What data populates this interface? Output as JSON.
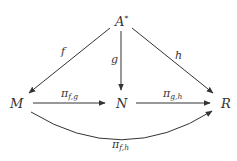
{
  "diagram": {
    "type": "commutative-diagram",
    "nodes": {
      "A": {
        "base": "A",
        "sup": "*"
      },
      "M": {
        "label": "M"
      },
      "N": {
        "label": "N"
      },
      "R": {
        "label": "R"
      }
    },
    "edges": [
      {
        "from": "A*",
        "to": "M",
        "label": "f"
      },
      {
        "from": "A*",
        "to": "N",
        "label": "g"
      },
      {
        "from": "A*",
        "to": "R",
        "label": "h"
      },
      {
        "from": "M",
        "to": "N",
        "label_base": "π",
        "label_sub": "f,g"
      },
      {
        "from": "N",
        "to": "R",
        "label_base": "π",
        "label_sub": "g,h"
      },
      {
        "from": "M",
        "to": "R",
        "label_base": "π",
        "label_sub": "f,h",
        "curved": true
      }
    ],
    "colors": {
      "ink": "#333333",
      "background": "#ffffff"
    }
  }
}
